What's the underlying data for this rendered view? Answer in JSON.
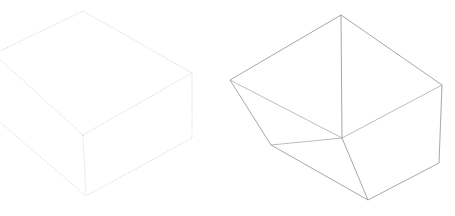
{
  "page": {
    "background_color": "#ffffff",
    "width": 455,
    "height": 216
  },
  "figures": [
    {
      "id": "left-figure",
      "name": "dotted-wireframe-box",
      "label": "Left box — dotted outline, cropped at left edge",
      "style": "dotted",
      "stroke_color": "#c9c9cf",
      "stroke_width": 0.8,
      "dash_pattern": "1 1.25",
      "cropped_edges": [
        "left"
      ],
      "vertices": {
        "top_back": [
          83,
          11
        ],
        "top_left": [
          -6,
          54
        ],
        "top_right": [
          192,
          73
        ],
        "top_front": [
          83,
          135
        ],
        "bottom_back": [
          83,
          11
        ],
        "bottom_left": [
          -6,
          117
        ],
        "bottom_right": [
          192,
          138
        ],
        "bottom_front": [
          86,
          196
        ]
      },
      "edges": [
        [
          "top_back",
          "top_left"
        ],
        [
          "top_back",
          "top_right"
        ],
        [
          "top_left",
          "top_front"
        ],
        [
          "top_right",
          "top_front"
        ],
        [
          "top_left",
          "bottom_left"
        ],
        [
          "top_right",
          "bottom_right"
        ],
        [
          "top_front",
          "bottom_front"
        ],
        [
          "bottom_left",
          "bottom_front"
        ],
        [
          "bottom_right",
          "bottom_front"
        ]
      ]
    },
    {
      "id": "right-figure",
      "name": "solid-wireframe-box",
      "label": "Right box — solid outline, tapered open container",
      "style": "solid",
      "stroke_color": "#8a8a92",
      "stroke_width": 0.75,
      "dash_pattern": "none",
      "cropped_edges": [],
      "vertices": {
        "top_back": [
          341,
          15
        ],
        "top_left": [
          230,
          80
        ],
        "top_right": [
          442,
          85
        ],
        "top_front": [
          342,
          138
        ],
        "bottom_left": [
          271,
          145
        ],
        "bottom_right": [
          439,
          163
        ],
        "bottom_front": [
          368,
          200
        ]
      },
      "edges": [
        [
          "top_back",
          "top_left"
        ],
        [
          "top_back",
          "top_right"
        ],
        [
          "top_left",
          "top_front"
        ],
        [
          "top_right",
          "top_front"
        ],
        [
          "top_back",
          "top_front"
        ],
        [
          "top_left",
          "bottom_left"
        ],
        [
          "top_right",
          "bottom_right"
        ],
        [
          "top_front",
          "bottom_front"
        ],
        [
          "bottom_left",
          "bottom_front"
        ],
        [
          "bottom_right",
          "bottom_front"
        ],
        [
          "bottom_left",
          "top_front"
        ]
      ]
    }
  ]
}
